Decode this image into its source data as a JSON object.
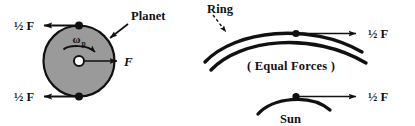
{
  "figure": {
    "background_color": "#ffffff",
    "ink_color": "#111111",
    "planet_fill_color": "#9a9a9a",
    "planet_hub_color": "#ffffff"
  },
  "left_panel": {
    "name": "planet-torque-diagram",
    "body_label": "Planet",
    "spin_symbol": "ω",
    "spin_subscript": "p",
    "center_force_label": "F",
    "top_force_label": "½ F",
    "bottom_force_label": "½ F"
  },
  "right_panel": {
    "name": "ring-sun-equal-forces-diagram",
    "ring_label": "Ring",
    "sun_label": "Sun",
    "note_label": "( Equal Forces )",
    "ring_force_label": "½ F",
    "sun_force_label": "½ F"
  },
  "icons": {
    "planet_disc": "filled-circle-icon",
    "rim_node": "dot-icon",
    "spin_arrow": "curved-arrow-icon",
    "force_arrow": "straight-arrow-icon",
    "pointer_arrow": "leader-arrow-icon",
    "pointer_arrow_dashed": "dashed-leader-arrow-icon",
    "ring_arc": "arc-icon",
    "sun_arc": "arc-icon"
  }
}
